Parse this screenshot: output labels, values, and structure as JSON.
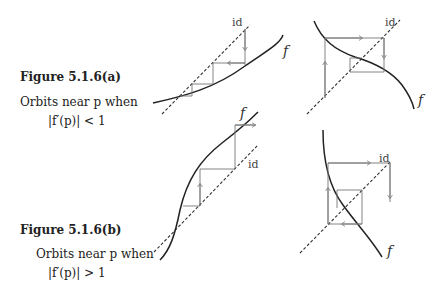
{
  "figure_a": {
    "title": "Figure 5.1.6(a)",
    "line1": "Orbits near p when",
    "line2": "|f′(p)| < 1"
  },
  "figure_b": {
    "title": "Figure 5.1.6(b)",
    "line1": "Orbits near p when",
    "line2": "|f′(p)| > 1"
  },
  "labels": {
    "id": "id",
    "f": "f"
  },
  "colors": {
    "curve": "#222222",
    "diagonal": "#333333",
    "cobweb": "#777777"
  }
}
